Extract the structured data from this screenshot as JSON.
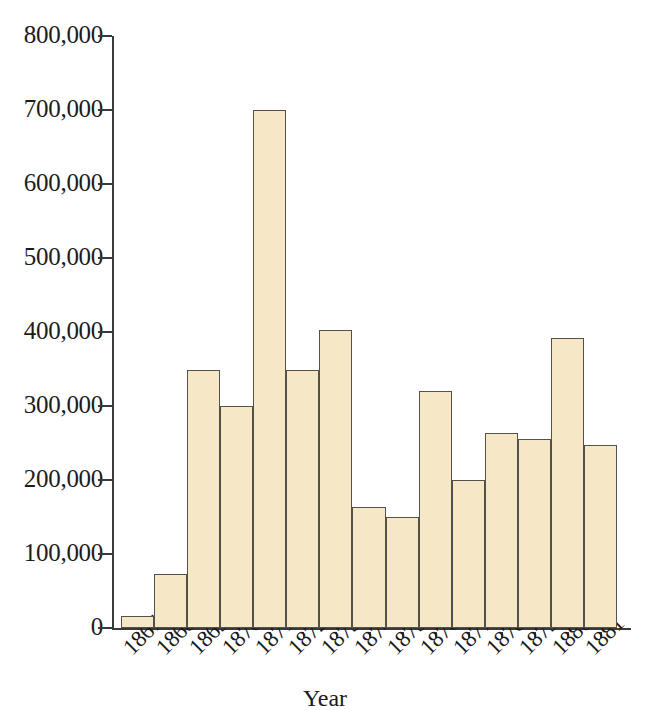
{
  "chart_data": {
    "type": "bar",
    "title": "",
    "subtitle": "",
    "xlabel": "Year",
    "ylabel": "",
    "categories": [
      "1867",
      "1868",
      "1869",
      "1870",
      "1871",
      "1872",
      "1873",
      "1874",
      "1875",
      "1876",
      "1877",
      "1878",
      "1879",
      "1880",
      "1881"
    ],
    "values": [
      16000,
      73000,
      349000,
      300000,
      700000,
      349000,
      403000,
      163000,
      150000,
      320000,
      200000,
      263000,
      255000,
      392000,
      247000
    ],
    "ylim": [
      0,
      800000
    ],
    "ytick_values": [
      800000,
      700000,
      600000,
      500000,
      400000,
      300000,
      200000,
      100000,
      0
    ],
    "ytick_labels": [
      "800,000",
      "700,000",
      "600,000",
      "500,000",
      "400,000",
      "300,000",
      "200,000",
      "100,000",
      "0"
    ],
    "grid": false,
    "legend": null,
    "bar_fill_color": "#f6e8c6",
    "bar_border_color": "#54504a",
    "axis_color": "#3a3a3a",
    "background_color": "#ffffff",
    "bar_gap": 0,
    "xtick_label_rotation": -45
  }
}
